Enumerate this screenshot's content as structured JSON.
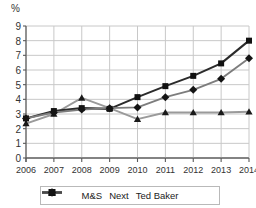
{
  "chart_data": {
    "type": "line",
    "title": "",
    "subtitle": "",
    "xlabel": "",
    "ylabel": "%",
    "unit_label": "%",
    "categories": [
      "2006",
      "2007",
      "2008",
      "2009",
      "2010",
      "2011",
      "2012",
      "2013",
      "2014"
    ],
    "x": [
      2006,
      2007,
      2008,
      2009,
      2010,
      2011,
      2012,
      2013,
      2014
    ],
    "ylim": [
      0,
      9
    ],
    "yticks": [
      0,
      1,
      2,
      3,
      4,
      5,
      6,
      7,
      8,
      9
    ],
    "ytick_labels": [
      "0",
      "1",
      "2",
      "3",
      "4",
      "5",
      "6",
      "7",
      "8",
      "9"
    ],
    "grid": true,
    "grid_axis": "both",
    "legend_position": "bottom",
    "series": [
      {
        "name": "M&S",
        "marker": "triangle",
        "color": "#9a9a9a",
        "marker_color": "#1a1a1a",
        "values": [
          2.35,
          3.0,
          4.1,
          3.4,
          2.65,
          3.1,
          3.1,
          3.1,
          3.15
        ]
      },
      {
        "name": "Next",
        "marker": "square",
        "color": "#2b2b2b",
        "marker_color": "#111111",
        "values": [
          2.7,
          3.2,
          3.4,
          3.35,
          4.15,
          4.9,
          5.6,
          6.45,
          8.0
        ]
      },
      {
        "name": "Ted Baker",
        "marker": "diamond",
        "color": "#7d7d7d",
        "marker_color": "#141414",
        "values": [
          2.7,
          3.1,
          3.3,
          3.4,
          3.45,
          4.15,
          4.65,
          5.4,
          6.8
        ]
      }
    ]
  },
  "legend": {
    "items": [
      {
        "label": "M&S"
      },
      {
        "label": "Next"
      },
      {
        "label": "Ted Baker"
      }
    ]
  },
  "axes": {
    "unit": "%"
  },
  "colors": {
    "grid": "#c8c8c8",
    "axis": "#5a5a5a",
    "text": "#333333",
    "legend_border": "#b9b9b9"
  }
}
